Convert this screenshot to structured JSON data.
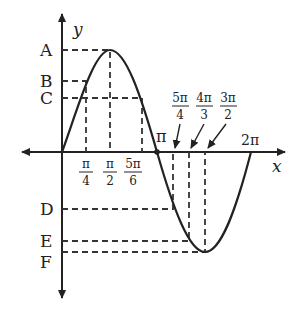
{
  "diagram": {
    "type": "sine-curve-graph",
    "function": "y = sin x (one period)",
    "axes": {
      "x_label": "x",
      "y_label": "y"
    },
    "y_levels": [
      {
        "label": "A",
        "x_value": "π/2"
      },
      {
        "label": "B",
        "x_value": "π/4"
      },
      {
        "label": "C",
        "x_value": "5π/6"
      },
      {
        "label": "D",
        "x_value": "5π/4"
      },
      {
        "label": "E",
        "x_value": "4π/3"
      },
      {
        "label": "F",
        "x_value": "3π/2"
      }
    ],
    "x_ticks_below": [
      {
        "num": "π",
        "den": "4"
      },
      {
        "num": "π",
        "den": "2"
      },
      {
        "num": "5π",
        "den": "6"
      }
    ],
    "x_ticks_above": [
      {
        "num": "5π",
        "den": "4"
      },
      {
        "num": "4π",
        "den": "3"
      },
      {
        "num": "3π",
        "den": "2"
      }
    ],
    "pi_label": "π",
    "two_pi_label": "2π",
    "colors": {
      "ink": "#222222",
      "background": "#ffffff"
    }
  }
}
